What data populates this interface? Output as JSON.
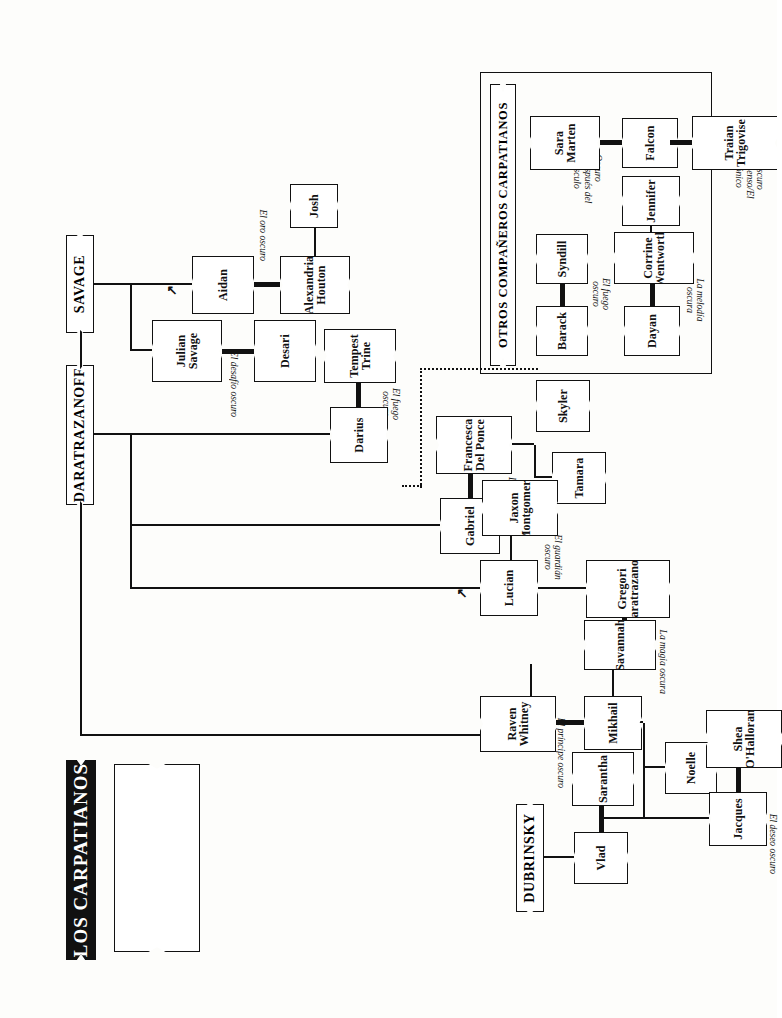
{
  "title": "LOS CARPATIANOS",
  "legend": {
    "heading": "Clave",
    "items": [
      {
        "label": "Compañero/a eterno/a",
        "symbol": "thick-line"
      },
      {
        "label": "Hermanos",
        "symbol": "thin-line"
      },
      {
        "label": "Gemelos",
        "symbol": "y-mark"
      },
      {
        "label": "Descendencia",
        "symbol": "tee-mark"
      },
      {
        "label": "Niños adoptados",
        "symbol": "dotted-line"
      }
    ]
  },
  "families": {
    "savage": "SAVAGE",
    "daratrazanoff": "DARATRAZANOFF",
    "dubrinsky": "DUBRINSKY",
    "otros": "OTROS COMPAÑEROS CARPATIANOS",
    "justicano": "JUSTICANO/BELANDRAKE"
  },
  "savage_branch": {
    "julian": "Julian Savage",
    "desari": "Desari",
    "aidan": "Aidan",
    "alexandria": "Alexandria Houton",
    "josh": "Josh",
    "book_julian": "El desafío oscuro",
    "book_aidan": "El oro oscuro"
  },
  "daratrazanoff_branch": {
    "darius": "Darius",
    "tempest": "Tempest Trine",
    "gabriel": "Gabriel",
    "francesca": "Francesca Del Ponce",
    "skyler": "Skyler",
    "tamara": "Tamara",
    "lucian": "Lucian",
    "jaxon": "Jaxon Montgomery",
    "gregori": "Gregori Daratrazanoff",
    "book_darius": "El fuego oscuro",
    "book_gabriel": "La leyenda oscura",
    "book_lucian": "El guardián oscuro"
  },
  "dubrinsky_branch": {
    "vlad": "Vlad",
    "sarantha": "Sarantha",
    "mikhail": "Mikhail",
    "raven": "Raven Whitney",
    "savannah": "Savannah",
    "noelle": "Noelle",
    "jacques": "Jacques",
    "shea": "Shea O'Halloran",
    "book_mikhail": "El príncipe oscuro",
    "book_savannah": "La magia oscura",
    "book_jacques": "El deseo oscuro"
  },
  "otros_branch": {
    "barack": "Barack",
    "syndill": "Syndill",
    "dayan": "Dayan",
    "corrine": "Corrine Wentworth",
    "jennifer": "Jennifer",
    "falcon": "Falcon",
    "sara": "Sara Marten",
    "traian": "Traian Trigovise",
    "joie": "Joie Sanders",
    "gabrielle": "Gabrielle",
    "jubal": "Jubal",
    "celeste": "Celeste",
    "eric": "Eric",
    "book_barack": "El fuego oscuro",
    "book_dayan": "La melodía oscura",
    "book_falcon": "Oscuro sueño/Después del crepúsculo",
    "book_traian": "Oscuro descenso/El iónico"
  },
  "justicano_branch": {
    "byron": "Byron Justicano",
    "antonietta": "Antonietta Scarletti",
    "eleanor": "Eleanor",
    "vlad_belandrake": "Vlad Belandrake",
    "diedre": "Diedre",
    "tienn": "Tienn",
    "benjamin": "Benjamin",
    "josef": "Josef",
    "book_byron": "Oscura sinfonía",
    "book_antonietta": "La maldición Scarletti"
  }
}
